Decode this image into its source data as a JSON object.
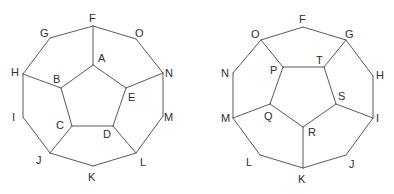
{
  "colors": {
    "edge": "#5a5a5a",
    "label": "#2e2e2e",
    "background": "#ffffff"
  },
  "diagrams": [
    {
      "id": "left",
      "vertices": {
        "F": [
          93,
          26
        ],
        "G": [
          50,
          38
        ],
        "O": [
          136,
          39
        ],
        "H": [
          23,
          74
        ],
        "N": [
          163,
          73
        ],
        "I": [
          23,
          117
        ],
        "M": [
          163,
          116
        ],
        "J": [
          50,
          153
        ],
        "L": [
          136,
          153
        ],
        "K": [
          93,
          166
        ],
        "A": [
          93,
          65
        ],
        "B": [
          61,
          88
        ],
        "E": [
          126,
          88
        ],
        "C": [
          72,
          126
        ],
        "D": [
          113,
          126
        ]
      },
      "edges": [
        [
          "F",
          "G"
        ],
        [
          "G",
          "H"
        ],
        [
          "H",
          "I"
        ],
        [
          "I",
          "J"
        ],
        [
          "J",
          "K"
        ],
        [
          "K",
          "L"
        ],
        [
          "L",
          "M"
        ],
        [
          "M",
          "N"
        ],
        [
          "N",
          "O"
        ],
        [
          "O",
          "F"
        ],
        [
          "A",
          "B"
        ],
        [
          "B",
          "C"
        ],
        [
          "C",
          "D"
        ],
        [
          "D",
          "E"
        ],
        [
          "E",
          "A"
        ],
        [
          "F",
          "A"
        ],
        [
          "H",
          "B"
        ],
        [
          "J",
          "C"
        ],
        [
          "L",
          "D"
        ],
        [
          "N",
          "E"
        ]
      ],
      "labels": [
        {
          "text": "F",
          "x": 89,
          "y": 22
        },
        {
          "text": "G",
          "x": 40,
          "y": 37
        },
        {
          "text": "O",
          "x": 135,
          "y": 37
        },
        {
          "text": "H",
          "x": 11,
          "y": 76
        },
        {
          "text": "N",
          "x": 165,
          "y": 77
        },
        {
          "text": "I",
          "x": 12,
          "y": 121
        },
        {
          "text": "M",
          "x": 164,
          "y": 121
        },
        {
          "text": "J",
          "x": 36,
          "y": 164
        },
        {
          "text": "L",
          "x": 140,
          "y": 166
        },
        {
          "text": "K",
          "x": 88,
          "y": 181
        },
        {
          "text": "A",
          "x": 98,
          "y": 62
        },
        {
          "text": "B",
          "x": 53,
          "y": 83
        },
        {
          "text": "E",
          "x": 128,
          "y": 101
        },
        {
          "text": "C",
          "x": 56,
          "y": 129
        },
        {
          "text": "D",
          "x": 103,
          "y": 138
        }
      ]
    },
    {
      "id": "right",
      "vertices": {
        "F": [
          303,
          27
        ],
        "O": [
          261,
          40
        ],
        "G": [
          346,
          40
        ],
        "N": [
          233,
          73
        ],
        "H": [
          373,
          76
        ],
        "M": [
          233,
          118
        ],
        "I": [
          373,
          118
        ],
        "L": [
          260,
          155
        ],
        "J": [
          346,
          155
        ],
        "K": [
          303,
          168
        ],
        "P": [
          283,
          67
        ],
        "T": [
          324,
          67
        ],
        "Q": [
          270,
          104
        ],
        "S": [
          336,
          104
        ],
        "R": [
          303,
          127
        ]
      },
      "edges": [
        [
          "F",
          "G"
        ],
        [
          "G",
          "H"
        ],
        [
          "H",
          "I"
        ],
        [
          "I",
          "J"
        ],
        [
          "J",
          "K"
        ],
        [
          "K",
          "L"
        ],
        [
          "L",
          "M"
        ],
        [
          "M",
          "N"
        ],
        [
          "N",
          "O"
        ],
        [
          "O",
          "F"
        ],
        [
          "P",
          "T"
        ],
        [
          "T",
          "S"
        ],
        [
          "S",
          "R"
        ],
        [
          "R",
          "Q"
        ],
        [
          "Q",
          "P"
        ],
        [
          "O",
          "P"
        ],
        [
          "G",
          "T"
        ],
        [
          "I",
          "S"
        ],
        [
          "K",
          "R"
        ],
        [
          "M",
          "Q"
        ]
      ],
      "labels": [
        {
          "text": "F",
          "x": 299,
          "y": 23
        },
        {
          "text": "O",
          "x": 251,
          "y": 38
        },
        {
          "text": "G",
          "x": 345,
          "y": 38
        },
        {
          "text": "N",
          "x": 221,
          "y": 77
        },
        {
          "text": "H",
          "x": 376,
          "y": 79
        },
        {
          "text": "M",
          "x": 221,
          "y": 122
        },
        {
          "text": "I",
          "x": 376,
          "y": 122
        },
        {
          "text": "L",
          "x": 246,
          "y": 166
        },
        {
          "text": "J",
          "x": 349,
          "y": 168
        },
        {
          "text": "K",
          "x": 298,
          "y": 183
        },
        {
          "text": "P",
          "x": 270,
          "y": 74
        },
        {
          "text": "T",
          "x": 316,
          "y": 64
        },
        {
          "text": "S",
          "x": 338,
          "y": 100
        },
        {
          "text": "Q",
          "x": 264,
          "y": 120
        },
        {
          "text": "R",
          "x": 308,
          "y": 136
        }
      ]
    }
  ]
}
